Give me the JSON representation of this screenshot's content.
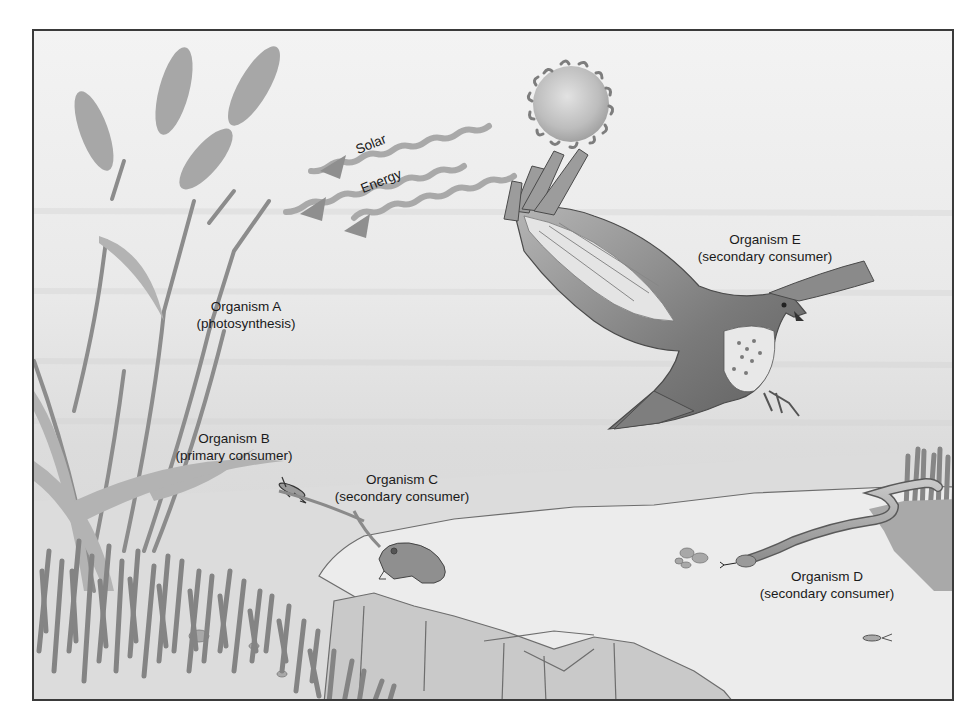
{
  "diagram": {
    "type": "food-chain illustration",
    "colors": {
      "frame_border": "#3a3a3a",
      "sky_top": "#f3f3f3",
      "ground": "#e6e6e6",
      "vegetation": "#8a8a8a",
      "label_text": "#1a1a1a"
    },
    "energy_source": {
      "label_line1": "Solar",
      "label_line2": "Energy",
      "icon": "sun-icon"
    },
    "organisms": [
      {
        "id": "A",
        "name": "Organism A",
        "role": "(photosynthesis)",
        "depiction": "grass-plant"
      },
      {
        "id": "B",
        "name": "Organism B",
        "role": "(primary consumer)",
        "depiction": "grasshopper"
      },
      {
        "id": "C",
        "name": "Organism C",
        "role": "(secondary consumer)",
        "depiction": "toad"
      },
      {
        "id": "D",
        "name": "Organism D",
        "role": "(secondary consumer)",
        "depiction": "snake"
      },
      {
        "id": "E",
        "name": "Organism E",
        "role": "(secondary consumer)",
        "depiction": "hawk"
      }
    ]
  }
}
